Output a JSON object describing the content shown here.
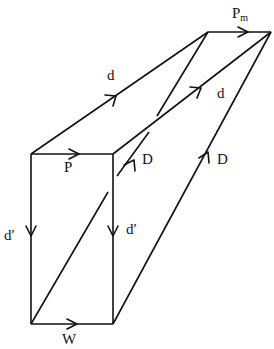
{
  "diagram": {
    "type": "vector-prism",
    "stroke_color": "#111111",
    "background": "#ffffff",
    "vertices": {
      "box_top_left": [
        31,
        154
      ],
      "box_top_right": [
        113,
        154
      ],
      "box_bottom_left": [
        31,
        324
      ],
      "box_bottom_right": [
        113,
        324
      ],
      "far_top_left": [
        208,
        32
      ],
      "far_top_right": [
        271,
        32
      ]
    },
    "labels": {
      "P": "P",
      "Pm_main": "P",
      "Pm_sub": "m",
      "d_upper": "d",
      "d_middle": "d",
      "D_inner": "D",
      "D_outer": "D",
      "d_prime_left": "d′",
      "d_prime_right": "d′",
      "W": "W"
    },
    "edges": [
      {
        "name": "P",
        "from": "box_top_left",
        "to": "box_top_right",
        "direction": "right"
      },
      {
        "name": "W",
        "from": "box_bottom_left",
        "to": "box_bottom_right",
        "direction": "right"
      },
      {
        "name": "d'-left",
        "from": "box_top_left",
        "to": "box_bottom_left",
        "direction": "down"
      },
      {
        "name": "d'-right",
        "from": "box_top_right",
        "to": "box_bottom_right",
        "direction": "down"
      },
      {
        "name": "Pm",
        "from": "far_top_left",
        "to": "far_top_right",
        "direction": "right"
      },
      {
        "name": "d-upper",
        "from": "box_top_left",
        "to": "far_top_left",
        "direction": "up-right"
      },
      {
        "name": "d-middle",
        "from": "box_top_right",
        "to": "far_top_right",
        "direction": "up-right"
      },
      {
        "name": "D-outer",
        "from": "box_bottom_right",
        "to": "far_top_right",
        "direction": "up-right"
      },
      {
        "name": "D-inner",
        "from": "box_bottom_left",
        "to": "far_top_left",
        "direction": "up-right",
        "style": "broken"
      }
    ]
  }
}
